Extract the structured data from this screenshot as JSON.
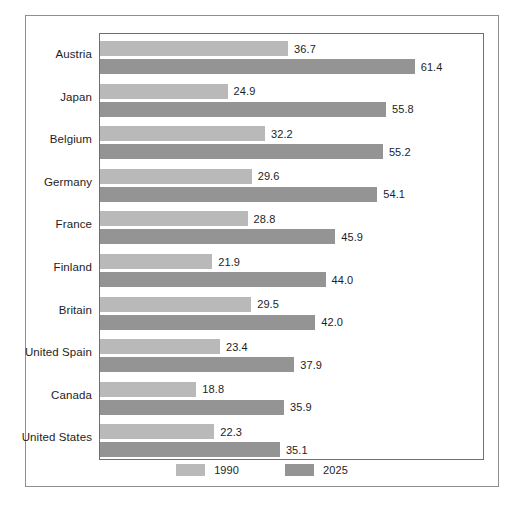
{
  "chart_data": {
    "type": "bar",
    "orientation": "horizontal",
    "title": "",
    "subtitle": "",
    "xlabel": "",
    "ylabel": "",
    "grid": false,
    "legend_position": "bottom-center",
    "xlim": [
      0,
      75
    ],
    "categories": [
      "Austria",
      "Japan",
      "Belgium",
      "Germany",
      "France",
      "Finland",
      "Britain",
      "United Spain",
      "Canada",
      "United States"
    ],
    "series": [
      {
        "name": "1990",
        "color": "#b9b9b9",
        "values": [
          36.7,
          24.9,
          32.2,
          29.6,
          28.8,
          21.9,
          29.5,
          23.4,
          18.8,
          22.3
        ],
        "labels": [
          "36.7",
          "24.9",
          "32.2",
          "29.6",
          "28.8",
          "21.9",
          "29.5",
          "23.4",
          "18.8",
          "22.3"
        ]
      },
      {
        "name": "2025",
        "color": "#949494",
        "values": [
          61.4,
          55.8,
          55.2,
          54.1,
          45.9,
          44.0,
          42.0,
          37.9,
          35.9,
          35.1
        ],
        "labels": [
          "61.4",
          "55.8",
          "55.2",
          "54.1",
          "45.9",
          "44.0",
          "42.0",
          "37.9",
          "35.9",
          "35.1"
        ]
      }
    ]
  },
  "legend": {
    "items": [
      {
        "label": "1990",
        "color": "#b9b9b9"
      },
      {
        "label": "2025",
        "color": "#949494"
      }
    ]
  },
  "colors": {
    "series_1990": "#b9b9b9",
    "series_2025": "#949494",
    "plot_border": "#6f6f6f",
    "figure_border": "#8e8e8e",
    "text": "#1d1d1d",
    "background": "#ffffff"
  }
}
